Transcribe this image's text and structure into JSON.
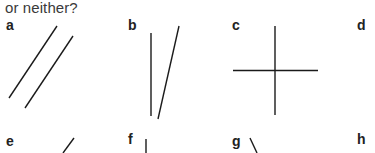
{
  "question": {
    "text_fragment": "or neither?"
  },
  "panels": [
    {
      "label": "a",
      "description": "two parallel diagonal lines"
    },
    {
      "label": "b",
      "description": "one vertical line and one slanted line (non-parallel)"
    },
    {
      "label": "c",
      "description": "perpendicular vertical and horizontal lines crossing"
    },
    {
      "label": "d",
      "description": ""
    },
    {
      "label": "e",
      "description": "diagonal line (partially visible)"
    },
    {
      "label": "f",
      "description": "vertical line (partially visible)"
    },
    {
      "label": "g",
      "description": "backslash diagonal line (partially visible)"
    },
    {
      "label": "h",
      "description": ""
    }
  ],
  "colors": {
    "line": "#1a1a1a",
    "text": "#3a3a3a",
    "label": "#222222",
    "background": "#ffffff"
  }
}
